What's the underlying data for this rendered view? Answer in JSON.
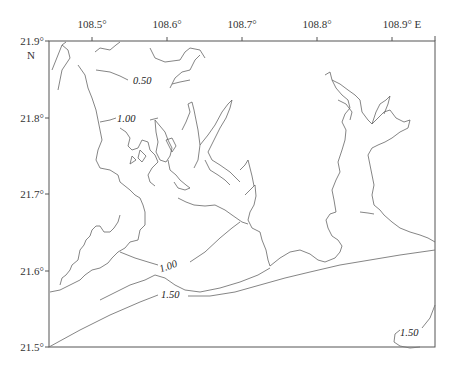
{
  "map": {
    "frame": {
      "x": 49,
      "y": 41,
      "width": 386,
      "height": 306
    },
    "longitude_ticks": [
      {
        "label": "108.5°",
        "x": 92
      },
      {
        "label": "108.6°",
        "x": 167
      },
      {
        "label": "108.7°",
        "x": 242
      },
      {
        "label": "108.8°",
        "x": 317
      },
      {
        "label": "108.9° E",
        "x": 392
      }
    ],
    "latitude_ticks": [
      {
        "label": "21.9°",
        "y": 41
      },
      {
        "label": "21.8°",
        "y": 118
      },
      {
        "label": "21.7°",
        "y": 194
      },
      {
        "label": "21.6°",
        "y": 271
      },
      {
        "label": "21.5°",
        "y": 347
      }
    ],
    "lat_hemisphere": "N",
    "contour_labels": [
      {
        "text": "0.50",
        "x": 140,
        "y": 84,
        "rotate": 5
      },
      {
        "text": "1.00",
        "x": 127,
        "y": 120,
        "rotate": 3
      },
      {
        "text": "1.00",
        "x": 168,
        "y": 266,
        "rotate": -20
      },
      {
        "text": "1.50",
        "x": 170,
        "y": 295,
        "rotate": 6
      },
      {
        "text": "1.50",
        "x": 409,
        "y": 333,
        "rotate": 0
      }
    ],
    "colors": {
      "line": "#555555",
      "frame": "#444444",
      "text": "#222222"
    }
  }
}
